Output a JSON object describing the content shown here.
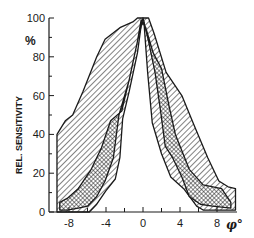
{
  "chart_data": {
    "type": "area",
    "title": "",
    "xlabel": "φ°",
    "ylabel": "REL. SENSITIVITY",
    "y_unit": "%",
    "xlim": [
      -9.3,
      10
    ],
    "ylim": [
      0,
      100
    ],
    "x_ticks": [
      -8,
      -4,
      0,
      4,
      8
    ],
    "x_minor_ticks": [
      -6,
      -2,
      2,
      6
    ],
    "y_ticks": [
      0,
      20,
      40,
      60,
      80,
      100
    ],
    "y_minor_ticks": [
      10,
      30,
      50,
      70,
      90
    ],
    "grid": false,
    "legend": null,
    "series": [
      {
        "name": "outer envelope (diagonal hatch)",
        "fill": "hatch-diagonal",
        "upper": [
          [
            -9.3,
            40
          ],
          [
            -8.4,
            47
          ],
          [
            -7.6,
            50
          ],
          [
            -6.5,
            62
          ],
          [
            -5,
            80
          ],
          [
            -4.1,
            89
          ],
          [
            -2.5,
            95
          ],
          [
            -1.1,
            98
          ],
          [
            -0.6,
            100
          ],
          [
            0.6,
            100
          ],
          [
            1.2,
            92
          ],
          [
            2.5,
            72
          ],
          [
            4.2,
            60
          ],
          [
            5.5,
            45
          ],
          [
            7,
            28
          ],
          [
            8.2,
            16
          ],
          [
            9.2,
            13
          ],
          [
            10,
            12
          ]
        ],
        "lower": [
          [
            -9.3,
            0
          ],
          [
            -5.8,
            0
          ],
          [
            -5,
            4
          ],
          [
            -4,
            11
          ],
          [
            -3,
            17
          ],
          [
            -2.5,
            28
          ],
          [
            -2.2,
            48
          ],
          [
            -1.5,
            62
          ],
          [
            -0.6,
            82
          ],
          [
            -0.2,
            96
          ],
          [
            0.1,
            98
          ],
          [
            0.5,
            72
          ],
          [
            1,
            46
          ],
          [
            2,
            30
          ],
          [
            3,
            18
          ],
          [
            4.4,
            12
          ],
          [
            5.8,
            3
          ],
          [
            6.5,
            1
          ],
          [
            10,
            1
          ]
        ]
      },
      {
        "name": "inner envelope (cross hatch)",
        "fill": "hatch-cross",
        "upper": [
          [
            -9,
            5
          ],
          [
            -8.2,
            7
          ],
          [
            -7,
            12
          ],
          [
            -5.6,
            22
          ],
          [
            -4.5,
            33
          ],
          [
            -3.5,
            47
          ],
          [
            -2.3,
            52
          ],
          [
            -1.4,
            70
          ],
          [
            -0.6,
            88
          ],
          [
            -0.2,
            99
          ],
          [
            0.3,
            95
          ],
          [
            1.1,
            82
          ],
          [
            2,
            74
          ],
          [
            2.8,
            55
          ],
          [
            3.5,
            40
          ],
          [
            5,
            22
          ],
          [
            6.5,
            14
          ],
          [
            8.5,
            12
          ],
          [
            9.5,
            5
          ]
        ],
        "lower": [
          [
            -9,
            1
          ],
          [
            -8.2,
            1
          ],
          [
            -7,
            2
          ],
          [
            -6,
            3
          ],
          [
            -5,
            8
          ],
          [
            -4.1,
            16
          ],
          [
            -3.2,
            28
          ],
          [
            -2.6,
            50
          ],
          [
            -1.5,
            68
          ],
          [
            -0.6,
            88
          ],
          [
            0,
            100
          ],
          [
            0.6,
            88
          ],
          [
            1.3,
            72
          ],
          [
            1.9,
            52
          ],
          [
            2.4,
            34
          ],
          [
            3.2,
            28
          ],
          [
            4.2,
            18
          ],
          [
            5,
            8
          ],
          [
            6.2,
            4
          ],
          [
            7.5,
            3
          ],
          [
            9.5,
            2
          ]
        ]
      }
    ]
  },
  "axes": {
    "y_unit_label": "%",
    "y_axis_label": "REL. SENSITIVITY",
    "x_axis_label": "φ°",
    "y_tick_labels": [
      "0",
      "20",
      "40",
      "60",
      "80",
      "100"
    ],
    "x_tick_labels": [
      "-8",
      "-4",
      "0",
      "4",
      "8"
    ]
  },
  "colors": {
    "ink": "#1a1a1a",
    "background": "#ffffff"
  }
}
